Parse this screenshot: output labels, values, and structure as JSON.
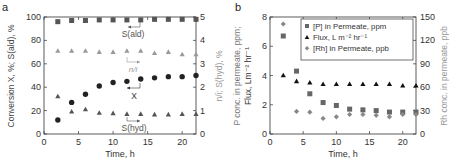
{
  "chart_data": [
    {
      "panel": "a",
      "type": "scatter",
      "xlabel": "Time, h",
      "ylabel": "Conversion X, %; S(ald), %",
      "y2label": "n/i; S(hyd), %",
      "xlim": [
        0,
        22
      ],
      "ylim": [
        0,
        100
      ],
      "y2lim": [
        0,
        5
      ],
      "xticks": [
        0,
        5,
        10,
        15,
        20
      ],
      "yticks": [
        0,
        20,
        40,
        60,
        80,
        100
      ],
      "y2ticks": [
        0,
        1,
        2,
        3,
        4,
        5
      ],
      "grid": false,
      "series": [
        {
          "name": "S(ald)",
          "axis": "left",
          "marker": "square",
          "color": "#555555",
          "x": [
            2,
            4,
            6,
            8,
            10,
            12,
            14,
            16,
            18,
            20,
            22
          ],
          "values": [
            96,
            97,
            97,
            97.5,
            97.5,
            97.5,
            97.5,
            98,
            98,
            98,
            98
          ]
        },
        {
          "name": "X",
          "axis": "left",
          "marker": "circle",
          "color": "#222222",
          "x": [
            2,
            4,
            6,
            8,
            10,
            12,
            14,
            16,
            18,
            20,
            22
          ],
          "values": [
            12,
            27,
            34,
            41,
            44,
            45,
            47,
            48,
            49,
            49,
            50
          ]
        },
        {
          "name": "n/i",
          "axis": "right",
          "marker": "triangle",
          "color": "#999999",
          "x": [
            2,
            4,
            6,
            8,
            10,
            12,
            14,
            16,
            18,
            20,
            22
          ],
          "values": [
            3.55,
            3.55,
            3.55,
            3.5,
            3.5,
            3.55,
            3.55,
            3.45,
            3.5,
            3.4,
            3.4
          ]
        },
        {
          "name": "S(hyd)",
          "axis": "right",
          "marker": "triangle",
          "color": "#555555",
          "x": [
            2,
            4,
            6,
            8,
            10,
            12,
            14,
            16,
            18,
            20,
            22
          ],
          "values": [
            1.6,
            0.95,
            1.05,
            0.9,
            0.88,
            0.85,
            0.85,
            0.83,
            0.83,
            0.85,
            0.85
          ]
        }
      ],
      "annotations": [
        {
          "text": "S(ald)",
          "x": 13,
          "y": 90
        },
        {
          "text": "n/i",
          "x": 13,
          "y": 62
        },
        {
          "text": "X",
          "x": 13,
          "y": 33
        },
        {
          "text": "S(hyd)",
          "x": 13,
          "y": 5
        }
      ]
    },
    {
      "panel": "b",
      "type": "scatter",
      "xlabel": "Time, h",
      "ylabel": "P conc. in permeate, ppm; Flux, Lm-2 hr-1",
      "y2label": "Rh conc. in permeate, ppb",
      "xlim": [
        0,
        22
      ],
      "ylim": [
        0,
        8
      ],
      "y2lim": [
        0,
        150
      ],
      "xticks": [
        0,
        5,
        10,
        15,
        20
      ],
      "yticks": [
        0,
        2,
        4,
        6,
        8
      ],
      "y2ticks": [
        0,
        30,
        60,
        90,
        120,
        150
      ],
      "grid": false,
      "legend_position": "upper right",
      "series": [
        {
          "name": "[P] in Permeate, ppm",
          "axis": "left",
          "marker": "square",
          "color": "#666666",
          "x": [
            2,
            4,
            6,
            8,
            10,
            12,
            14,
            16,
            18,
            20,
            22
          ],
          "values": [
            6.7,
            4.3,
            2.75,
            2.15,
            1.95,
            1.7,
            1.65,
            1.6,
            1.5,
            1.5,
            1.5
          ]
        },
        {
          "name": "Flux, L m-2 hr-1",
          "axis": "left",
          "marker": "triangle",
          "color": "#111111",
          "x": [
            2,
            4,
            6,
            8,
            10,
            12,
            14,
            16,
            18,
            20,
            22
          ],
          "values": [
            4.0,
            3.6,
            3.5,
            3.4,
            3.4,
            3.4,
            3.4,
            3.4,
            3.4,
            3.3,
            3.3
          ]
        },
        {
          "name": "[Rh] in Permeate, ppb",
          "axis": "right",
          "marker": "diamond",
          "color": "#888888",
          "x": [
            2,
            4,
            6,
            8,
            10,
            12,
            14,
            16,
            18,
            20,
            22
          ],
          "values": [
            141,
            29,
            28,
            20,
            22,
            25,
            25,
            24,
            22,
            25,
            25
          ]
        }
      ]
    }
  ],
  "labels": {
    "panel_a": "a",
    "panel_b": "b",
    "xlabel": "Time, h",
    "a_ylabel": "Conversion X, %; S(ald), %",
    "a_y2label": "n/i; S(hyd), %",
    "b_ylabel_1": "P conc. in permeate, ppm;",
    "b_ylabel_2": "Flux, Lm⁻² hr⁻¹",
    "b_y2label": "Rh conc. in permeate, ppb",
    "ann_sald": "S(ald)",
    "ann_ni": "n/i",
    "ann_x": "X",
    "ann_shyd": "S(hyd)",
    "legend_p": "[P] in Permeate, ppm",
    "legend_flux": "Flux, L m⁻² hr⁻¹",
    "legend_rh": "[Rh] in Permeate, ppb"
  },
  "ticks": {
    "x": [
      "0",
      "5",
      "10",
      "15",
      "20"
    ],
    "a_y": [
      "0",
      "20",
      "40",
      "60",
      "80",
      "100"
    ],
    "a_y2": [
      "0",
      "1",
      "2",
      "3",
      "4",
      "5"
    ],
    "b_y": [
      "0",
      "2",
      "4",
      "6",
      "8"
    ],
    "b_y2": [
      "0",
      "30",
      "60",
      "90",
      "120",
      "150"
    ]
  }
}
